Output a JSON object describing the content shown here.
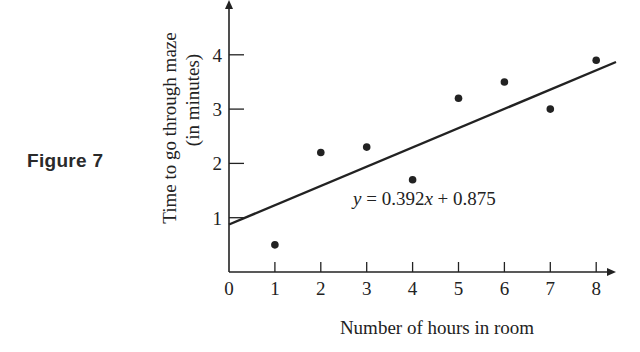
{
  "figure_label": "Figure 7",
  "colors": {
    "ink": "#222222",
    "background": "#ffffff"
  },
  "chart_data": {
    "type": "scatter",
    "title": "",
    "xlabel": "Number of hours in room",
    "ylabel": [
      "Time to go through maze",
      "(in minutes)"
    ],
    "x_ticks": [
      0,
      1,
      2,
      3,
      4,
      5,
      6,
      7,
      8
    ],
    "y_ticks": [
      1,
      2,
      3,
      4
    ],
    "xlim": [
      0,
      8.6
    ],
    "ylim": [
      0,
      4.9
    ],
    "grid": false,
    "legend": null,
    "series": [
      {
        "name": "observations",
        "x": [
          1,
          2,
          3,
          4,
          5,
          6,
          7,
          8
        ],
        "y": [
          0.5,
          2.2,
          2.3,
          1.7,
          3.2,
          3.5,
          3.0,
          3.9
        ]
      }
    ],
    "regression_line": {
      "slope": 0.392,
      "intercept": 0.875,
      "x_range": [
        0,
        8.4
      ],
      "annotation": "y = 0.392x + 0.875"
    }
  }
}
